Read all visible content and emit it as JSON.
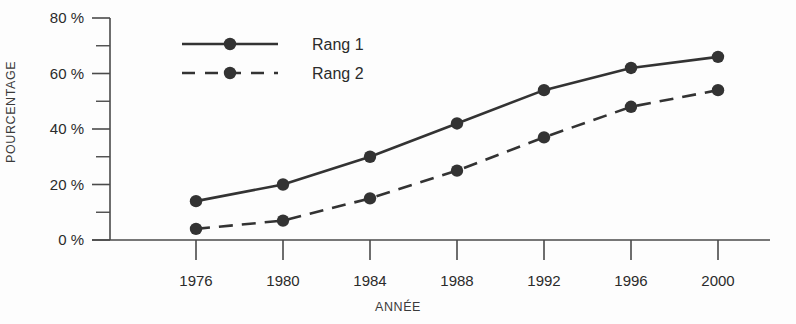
{
  "chart_data": {
    "type": "line",
    "title": "",
    "xlabel": "ANNÉE",
    "ylabel": "POURCENTAGE",
    "categories": [
      1976,
      1980,
      1984,
      1988,
      1992,
      1996,
      2000
    ],
    "x_tick_labels": [
      "1976",
      "1980",
      "1984",
      "1988",
      "1992",
      "1996",
      "2000"
    ],
    "y_tick_labels": [
      "0 %",
      "20 %",
      "40 %",
      "60 %",
      "80 %"
    ],
    "y_tick_values": [
      0,
      20,
      40,
      60,
      80
    ],
    "y_minor_ticks": [
      10,
      30,
      50,
      70
    ],
    "ylim": [
      0,
      80
    ],
    "grid": false,
    "legend_position": "top-left-inside",
    "series": [
      {
        "name": "Rang 1",
        "style": "solid",
        "marker": "circle",
        "color": "#333333",
        "values": [
          14,
          20,
          30,
          42,
          54,
          62,
          66
        ]
      },
      {
        "name": "Rang 2",
        "style": "dashed",
        "marker": "circle",
        "color": "#333333",
        "values": [
          4,
          7,
          15,
          25,
          37,
          48,
          54
        ]
      }
    ]
  },
  "colors": {
    "series": "#333333",
    "axis": "#4a4a4a",
    "text": "#2b2b2b",
    "background": "#fdfdfd"
  }
}
